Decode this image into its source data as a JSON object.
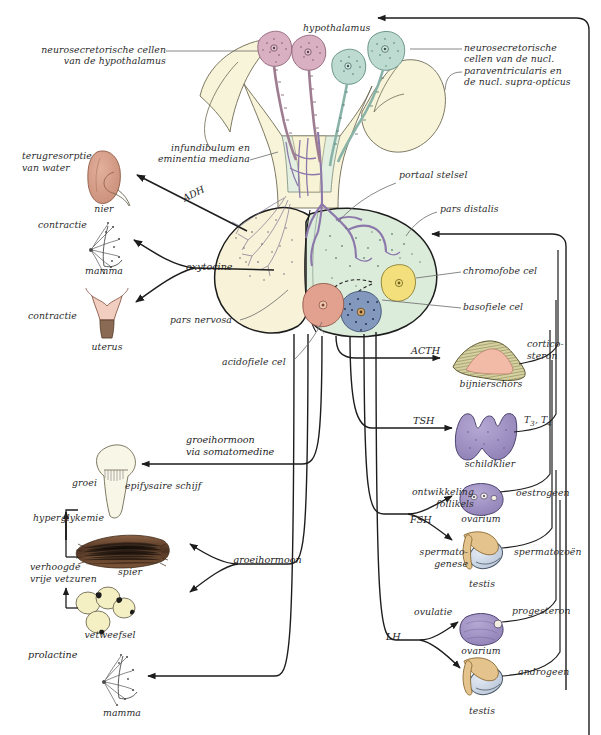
{
  "figure": {
    "language": "nl"
  },
  "colors": {
    "hypothalamus_fill": "#f7f4da",
    "pars_nervosa_fill": "#f7f2d6",
    "pars_distalis_fill": "#dceedd",
    "neuro_cell_magenta": "#d9afc0",
    "neuro_cell_teal": "#bcdcd2",
    "portal_vessel": "#9c86b8",
    "acidofiel_cell": "#e0a08f",
    "basofiel_cell": "#7d93b8",
    "chromofobe_cell": "#f2e07a",
    "kidney": "#d49a86",
    "uterus": "#f0ccc0",
    "adrenal_cortex": "#cfc98f",
    "adrenal_inner": "#f0b7a4",
    "thyroid": "#a294c4",
    "ovary": "#a294c4",
    "testis_body": "#cdd8e6",
    "testis_epi": "#e2c08a",
    "muscle": "#6b4a33",
    "fat": "#f4efc2",
    "bone": "#f7f5e4",
    "line": "#1d1d1d"
  },
  "anatomy_labels": [
    {
      "id": "hypothalamus",
      "text": "hypothalamus"
    },
    {
      "id": "neuro-cells-hypothalamus",
      "text": "neurosecretorische cellen\nvan de hypothalamus"
    },
    {
      "id": "neuro-cells-nuclei",
      "text": "neurosecretorische\ncellen van de nucl.\nparaventricularis en\nde nucl. supra-opticus"
    },
    {
      "id": "infundibulum",
      "text": "infundibulum en\neminentia mediana"
    },
    {
      "id": "portaal-stelsel",
      "text": "portaal stelsel"
    },
    {
      "id": "pars-distalis",
      "text": "pars distalis"
    },
    {
      "id": "pars-nervosa",
      "text": "pars nervosa"
    },
    {
      "id": "chromofobe-cel",
      "text": "chromofobe cel"
    },
    {
      "id": "basofiele-cel",
      "text": "basofiele cel"
    },
    {
      "id": "acidofiele-cel",
      "text": "acidofiele cel"
    }
  ],
  "hormones": [
    {
      "id": "adh",
      "text": "ADH"
    },
    {
      "id": "oxytocine",
      "text": "oxytocine"
    },
    {
      "id": "acth",
      "text": "ACTH"
    },
    {
      "id": "tsh",
      "text": "TSH"
    },
    {
      "id": "fsh",
      "text": "FSH"
    },
    {
      "id": "lh",
      "text": "LH"
    },
    {
      "id": "groeihormoon-somatomedine",
      "text": "groeihormoon\nvia somatomedine"
    },
    {
      "id": "groeihormoon",
      "text": "groeihormoon"
    },
    {
      "id": "prolactine",
      "text": "prolactine"
    }
  ],
  "targets_left": [
    {
      "id": "nier",
      "organ": "nier",
      "effect": "terugresorptie\nvan water"
    },
    {
      "id": "mamma-oxytocine",
      "organ": "mamma",
      "effect": "contractie"
    },
    {
      "id": "uterus",
      "organ": "uterus",
      "effect": "contractie"
    },
    {
      "id": "epifysaire-schijf",
      "organ": "epifysaire schijf",
      "effect": "groei"
    },
    {
      "id": "spier",
      "organ": "spier",
      "effect": "hyperglykemie"
    },
    {
      "id": "vetweefsel",
      "organ": "vetweefsel",
      "effect": "verhoogde\nvrije vetzuren"
    },
    {
      "id": "mamma-prolactine",
      "organ": "mamma",
      "effect": "prolactine"
    }
  ],
  "targets_right": [
    {
      "id": "bijnierschors",
      "organ": "bijnierschors",
      "tropic": "ACTH",
      "product": "cortico-\nsteron"
    },
    {
      "id": "schildklier",
      "organ": "schildklier",
      "tropic": "TSH",
      "product": "T3, T4"
    },
    {
      "id": "ovarium-fsh",
      "organ": "ovarium",
      "tropic": "FSH",
      "effect": "ontwikkeling\nfollikels",
      "product": "oestrogeen"
    },
    {
      "id": "testis-fsh",
      "organ": "testis",
      "tropic": "FSH",
      "effect": "spermato-\ngenese",
      "product": "spermatozoën"
    },
    {
      "id": "ovarium-lh",
      "organ": "ovarium",
      "tropic": "LH",
      "effect": "ovulatie",
      "product": "progesteron"
    },
    {
      "id": "testis-lh",
      "organ": "testis",
      "tropic": "LH",
      "product": "androgeen"
    }
  ],
  "subscripts": {
    "t3": "3",
    "t4": "4"
  }
}
